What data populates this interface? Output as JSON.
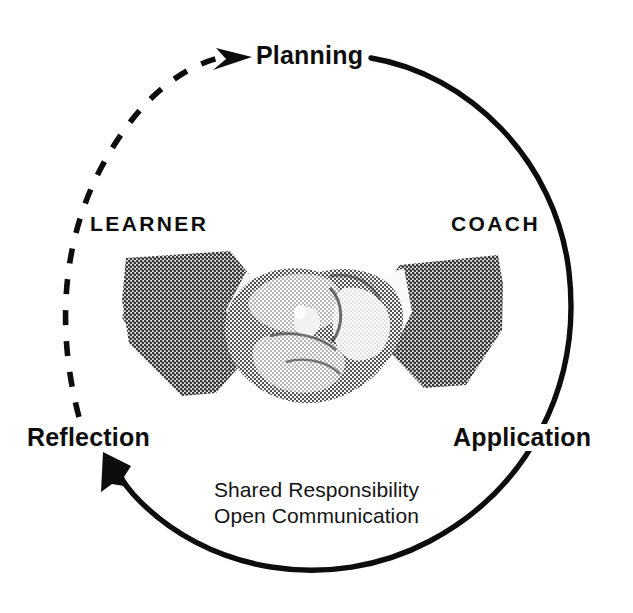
{
  "diagram": {
    "type": "cyclical-process-diagram",
    "background_color": "#ffffff",
    "ink_color": "#0d0d0d",
    "phases": [
      {
        "id": "planning",
        "label": "Planning",
        "position": "top"
      },
      {
        "id": "application",
        "label": "Application",
        "position": "right"
      },
      {
        "id": "reflection",
        "label": "Reflection",
        "position": "left-bottom"
      }
    ],
    "roles": [
      {
        "id": "learner",
        "label": "LEARNER",
        "position": "left"
      },
      {
        "id": "coach",
        "label": "COACH",
        "position": "right"
      }
    ],
    "values": {
      "line1": "Shared Responsibility",
      "line2": "Open Communication"
    },
    "arcs": [
      {
        "id": "solid-arc",
        "style": "solid",
        "description": "Planning to Application to Reflection",
        "arrowhead": "reflection",
        "stroke": "#0d0d0d",
        "stroke_width": 5
      },
      {
        "id": "dashed-arc",
        "style": "dashed",
        "description": "Reflection back to Planning",
        "arrowhead": "planning",
        "stroke": "#0d0d0d",
        "stroke_width": 5
      }
    ],
    "center_image": {
      "name": "handshake-photo",
      "description": "Halftone photograph of two people in dark suits shaking hands",
      "sleeve_color": "#5a5a5a",
      "hand_color": "#b4b4b4"
    }
  }
}
